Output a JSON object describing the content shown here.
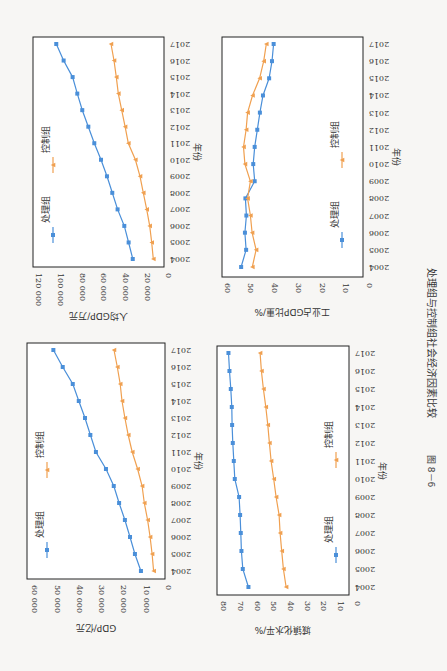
{
  "figure": {
    "caption_number": "图 8－6",
    "caption_text": "处理组与控制组社会经济因素比较",
    "orientation": "rotated 90° (page printed sideways)"
  },
  "colors": {
    "treatment": "#4a8fd9",
    "control": "#f0a050",
    "axis": "#222222",
    "text": "#333333"
  },
  "legend": {
    "treatment": "处理组",
    "control": "控制组"
  },
  "chart_data": [
    {
      "id": "gdp",
      "type": "line",
      "title": "",
      "xlabel": "年份",
      "ylabel": "GDP/亿元",
      "categories": [
        "2004",
        "2005",
        "2006",
        "2007",
        "2008",
        "2009",
        "2010",
        "2011",
        "2012",
        "2013",
        "2014",
        "2015",
        "2016",
        "2017"
      ],
      "ylim": [
        0,
        60000
      ],
      "yticks": [
        0,
        10000,
        20000,
        30000,
        40000,
        50000,
        60000
      ],
      "ytick_labels": [
        "0",
        "10 000",
        "20 000",
        "30 000",
        "40 000",
        "50 000",
        "60 000"
      ],
      "grid": false,
      "legend_position": "top-inside",
      "series": [
        {
          "name": "处理组",
          "marker": "square",
          "values": [
            9900,
            12600,
            14800,
            17100,
            19700,
            22100,
            25600,
            30100,
            32600,
            35000,
            37800,
            40500,
            45000,
            49200
          ]
        },
        {
          "name": "控制组",
          "marker": "triangle",
          "values": [
            4200,
            4900,
            5800,
            6900,
            8400,
            9400,
            11400,
            13800,
            15600,
            17100,
            18400,
            19200,
            20500,
            22000
          ]
        }
      ]
    },
    {
      "id": "gdp_per_capita",
      "type": "line",
      "title": "",
      "xlabel": "年份",
      "ylabel": "人均GDP/万元",
      "categories": [
        "2004",
        "2005",
        "2006",
        "2007",
        "2008",
        "2009",
        "2010",
        "2011",
        "2012",
        "2013",
        "2014",
        "2015",
        "2016",
        "2017"
      ],
      "ylim": [
        0,
        120000
      ],
      "yticks": [
        0,
        20000,
        40000,
        60000,
        80000,
        100000,
        120000
      ],
      "ytick_labels": [
        "0",
        "20 000",
        "40 000",
        "60 000",
        "80 000",
        "100 000",
        "120 000"
      ],
      "grid": false,
      "legend_position": "top-inside",
      "series": [
        {
          "name": "处理组",
          "marker": "square",
          "values": [
            28200,
            32000,
            36000,
            42200,
            47100,
            52000,
            57500,
            63700,
            69200,
            74800,
            79400,
            83700,
            92000,
            98800
          ]
        },
        {
          "name": "控制组",
          "marker": "triangle",
          "values": [
            9200,
            10700,
            12600,
            15300,
            18500,
            21500,
            25800,
            32300,
            35300,
            38400,
            41500,
            43400,
            45500,
            48300
          ]
        }
      ]
    },
    {
      "id": "urbanization",
      "type": "line",
      "title": "",
      "xlabel": "年份",
      "ylabel": "城镇化水平/%",
      "categories": [
        "2004",
        "2005",
        "2006",
        "2007",
        "2008",
        "2009",
        "2010",
        "2011",
        "2012",
        "2013",
        "2014",
        "2015",
        "2016",
        "2017"
      ],
      "ylim": [
        0,
        80
      ],
      "yticks": [
        0,
        10,
        20,
        30,
        40,
        50,
        60,
        70,
        80
      ],
      "ytick_labels": [
        "0",
        "10",
        "20",
        "30",
        "40",
        "50",
        "60",
        "70",
        "80"
      ],
      "grid": false,
      "legend_position": "bottom-inside",
      "series": [
        {
          "name": "处理组",
          "marker": "square",
          "values": [
            61.9,
            65.3,
            66.1,
            66.5,
            66.9,
            67.5,
            70.1,
            70.7,
            71.3,
            71.7,
            71.9,
            72.5,
            73.3,
            73.9
          ]
        },
        {
          "name": "控制组",
          "marker": "triangle",
          "values": [
            39.3,
            40.9,
            41.9,
            42.9,
            43.5,
            45.3,
            46.7,
            48.3,
            49.3,
            50.3,
            51.5,
            52.9,
            54.1,
            54.9
          ]
        }
      ]
    },
    {
      "id": "industry_share",
      "type": "line",
      "title": "",
      "xlabel": "年份",
      "ylabel": "工业占GDP比重/%",
      "categories": [
        "2004",
        "2005",
        "2006",
        "2007",
        "2008",
        "2009",
        "2010",
        "2011",
        "2012",
        "2013",
        "2014",
        "2015",
        "2016",
        "2017"
      ],
      "ylim": [
        0,
        60
      ],
      "yticks": [
        0,
        10,
        20,
        30,
        40,
        50,
        60
      ],
      "ytick_labels": [
        "0",
        "10",
        "20",
        "30",
        "40",
        "50",
        "60"
      ],
      "grid": false,
      "legend_position": "bottom-inside",
      "series": [
        {
          "name": "处理组",
          "marker": "square",
          "values": [
            51.8,
            49.7,
            50.2,
            49.6,
            50.0,
            46.1,
            46.7,
            46.1,
            45.0,
            43.9,
            42.6,
            40.0,
            38.8,
            38.1
          ]
        },
        {
          "name": "控制组",
          "marker": "triangle",
          "values": [
            47.1,
            45.5,
            47.2,
            47.9,
            49.1,
            47.9,
            50.2,
            50.8,
            49.7,
            49.1,
            47.0,
            44.0,
            42.3,
            41.2
          ]
        }
      ]
    }
  ]
}
